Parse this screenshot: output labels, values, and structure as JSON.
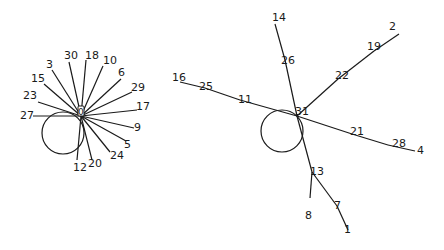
{
  "diagrams": [
    {
      "id": "left-star",
      "hub": {
        "label": "0",
        "x": 81,
        "y": 114
      },
      "loop": {
        "cx": 63,
        "cy": 133,
        "r": 21
      },
      "spokes": [
        {
          "label": "27",
          "x": 33,
          "y": 116,
          "lx": 20,
          "ly": 119
        },
        {
          "label": "23",
          "x": 38,
          "y": 102,
          "lx": 23,
          "ly": 99
        },
        {
          "label": "15",
          "x": 44,
          "y": 84,
          "lx": 31,
          "ly": 82
        },
        {
          "label": "3",
          "x": 52,
          "y": 70,
          "lx": 46,
          "ly": 68
        },
        {
          "label": "30",
          "x": 69,
          "y": 62,
          "lx": 64,
          "ly": 59
        },
        {
          "label": "18",
          "x": 86,
          "y": 60,
          "lx": 85,
          "ly": 59
        },
        {
          "label": "10",
          "x": 103,
          "y": 66,
          "lx": 103,
          "ly": 64
        },
        {
          "label": "6",
          "x": 121,
          "y": 79,
          "lx": 118,
          "ly": 76
        },
        {
          "label": "29",
          "x": 132,
          "y": 92,
          "lx": 131,
          "ly": 91
        },
        {
          "label": "17",
          "x": 137,
          "y": 110,
          "lx": 136,
          "ly": 110
        },
        {
          "label": "9",
          "x": 134,
          "y": 128,
          "lx": 134,
          "ly": 131
        },
        {
          "label": "5",
          "x": 126,
          "y": 141,
          "lx": 124,
          "ly": 148
        },
        {
          "label": "24",
          "x": 110,
          "y": 152,
          "lx": 110,
          "ly": 159
        },
        {
          "label": "20",
          "x": 92,
          "y": 160,
          "lx": 88,
          "ly": 167
        },
        {
          "label": "12",
          "x": 77,
          "y": 160,
          "lx": 73,
          "ly": 171
        }
      ]
    },
    {
      "id": "right-tree",
      "hub": {
        "label": "31",
        "x": 297,
        "y": 116
      },
      "loop": {
        "cx": 282,
        "cy": 131,
        "r": 21
      },
      "nodes": [
        {
          "label": "14",
          "x": 275,
          "y": 24,
          "lx": 272,
          "ly": 21
        },
        {
          "label": "26",
          "x": 285,
          "y": 60,
          "lx": 281,
          "ly": 64
        },
        {
          "label": "2",
          "x": 399,
          "y": 34,
          "lx": 389,
          "ly": 30
        },
        {
          "label": "19",
          "x": 374,
          "y": 51,
          "lx": 367,
          "ly": 50
        },
        {
          "label": "22",
          "x": 338,
          "y": 79,
          "lx": 335,
          "ly": 79
        },
        {
          "label": "16",
          "x": 180,
          "y": 82,
          "lx": 172,
          "ly": 81
        },
        {
          "label": "25",
          "x": 205,
          "y": 88,
          "lx": 199,
          "ly": 90
        },
        {
          "label": "11",
          "x": 240,
          "y": 100,
          "lx": 238,
          "ly": 103
        },
        {
          "label": "21",
          "x": 352,
          "y": 134,
          "lx": 350,
          "ly": 135
        },
        {
          "label": "28",
          "x": 388,
          "y": 145,
          "lx": 392,
          "ly": 147
        },
        {
          "label": "4",
          "x": 415,
          "y": 151,
          "lx": 417,
          "ly": 154
        },
        {
          "label": "13",
          "x": 312,
          "y": 172,
          "lx": 310,
          "ly": 175
        },
        {
          "label": "8",
          "x": 310,
          "y": 198,
          "lx": 305,
          "ly": 219
        },
        {
          "label": "7",
          "x": 337,
          "y": 206,
          "lx": 334,
          "ly": 209
        },
        {
          "label": "1",
          "x": 348,
          "y": 230,
          "lx": 344,
          "ly": 233
        }
      ],
      "edges": [
        [
          "31",
          "26"
        ],
        [
          "26",
          "14"
        ],
        [
          "31",
          "22"
        ],
        [
          "22",
          "19"
        ],
        [
          "19",
          "2"
        ],
        [
          "31",
          "11"
        ],
        [
          "11",
          "25"
        ],
        [
          "25",
          "16"
        ],
        [
          "31",
          "21"
        ],
        [
          "21",
          "28"
        ],
        [
          "28",
          "4"
        ],
        [
          "31",
          "13"
        ],
        [
          "13",
          "8"
        ],
        [
          "13",
          "7"
        ],
        [
          "7",
          "1"
        ]
      ]
    }
  ]
}
